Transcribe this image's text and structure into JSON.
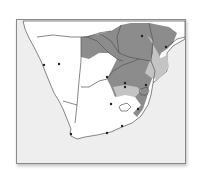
{
  "map": {
    "region": "Southern Africa",
    "type": "species distribution range map",
    "legend": [],
    "colors": {
      "ocean": "#eeeeee",
      "land": "#ffffff",
      "range_primary": "#8c8c8c",
      "range_secondary": "#c4c4c4",
      "border": "#555555",
      "city_marker": "#222222"
    },
    "city_markers": [
      {
        "x": 43,
        "y": 64
      },
      {
        "x": 58,
        "y": 63
      },
      {
        "x": 106,
        "y": 76
      },
      {
        "x": 124,
        "y": 82
      },
      {
        "x": 124,
        "y": 86
      },
      {
        "x": 145,
        "y": 84
      },
      {
        "x": 110,
        "y": 103
      },
      {
        "x": 137,
        "y": 108
      },
      {
        "x": 141,
        "y": 35
      },
      {
        "x": 165,
        "y": 46
      },
      {
        "x": 121,
        "y": 125
      },
      {
        "x": 106,
        "y": 132
      },
      {
        "x": 70,
        "y": 133
      }
    ]
  }
}
